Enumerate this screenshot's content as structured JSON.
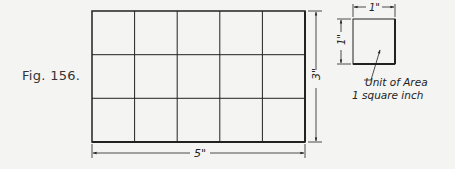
{
  "figure": {
    "caption": "Fig. 156.",
    "grid": {
      "columns": 5,
      "rows": 3
    },
    "width_label": "5\"",
    "height_label": "3\"",
    "unit_square": {
      "width_label": "1\"",
      "height_label": "1\"",
      "annotation_line1": "Unit of Area",
      "annotation_line2": "1 square inch"
    }
  }
}
